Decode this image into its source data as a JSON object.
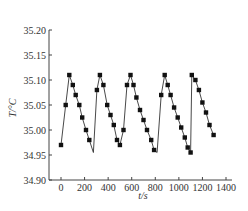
{
  "chart_data": {
    "type": "line",
    "title": "",
    "xlabel": "t/s",
    "ylabel": "T/°C",
    "xlim": [
      -50,
      1400
    ],
    "ylim": [
      34.9,
      35.2
    ],
    "x_ticks": [
      0,
      200,
      400,
      600,
      800,
      1000,
      1200,
      1400
    ],
    "x_tick_labels": [
      "0",
      "200",
      "400",
      "600",
      "800",
      "1000",
      "1200",
      "1400"
    ],
    "y_ticks": [
      34.9,
      34.95,
      35.0,
      35.05,
      35.1,
      35.15,
      35.2
    ],
    "y_tick_labels": [
      "34.90",
      "34.95",
      "35.00",
      "35.05",
      "35.10",
      "35.15",
      "35.20"
    ],
    "grid": false,
    "legend": null,
    "series": [
      {
        "name": "T",
        "marker": "square",
        "color": "#111111",
        "line_points": [
          [
            0,
            34.97
          ],
          [
            40,
            35.05
          ],
          [
            70,
            35.11
          ],
          [
            100,
            35.09
          ],
          [
            125,
            35.07
          ],
          [
            155,
            35.05
          ],
          [
            180,
            35.025
          ],
          [
            212,
            35.0
          ],
          [
            240,
            34.98
          ],
          [
            275,
            34.955
          ],
          [
            305,
            35.08
          ],
          [
            330,
            35.11
          ],
          [
            360,
            35.09
          ],
          [
            392,
            35.05
          ],
          [
            420,
            35.03
          ],
          [
            448,
            35.01
          ],
          [
            475,
            34.98
          ],
          [
            500,
            34.97
          ],
          [
            530,
            35.0
          ],
          [
            560,
            35.09
          ],
          [
            590,
            35.11
          ],
          [
            615,
            35.09
          ],
          [
            640,
            35.065
          ],
          [
            670,
            35.04
          ],
          [
            700,
            35.02
          ],
          [
            730,
            35.0
          ],
          [
            765,
            34.98
          ],
          [
            790,
            34.96
          ],
          [
            815,
            34.955
          ],
          [
            850,
            35.07
          ],
          [
            880,
            35.11
          ],
          [
            905,
            35.09
          ],
          [
            930,
            35.07
          ],
          [
            960,
            35.045
          ],
          [
            990,
            35.025
          ],
          [
            1020,
            35.005
          ],
          [
            1050,
            34.985
          ],
          [
            1075,
            34.965
          ],
          [
            1100,
            34.955
          ],
          [
            1110,
            35.11
          ],
          [
            1140,
            35.1
          ],
          [
            1170,
            35.08
          ],
          [
            1200,
            35.055
          ],
          [
            1230,
            35.035
          ],
          [
            1260,
            35.01
          ],
          [
            1295,
            34.99
          ]
        ],
        "markers": [
          [
            0,
            34.97
          ],
          [
            40,
            35.05
          ],
          [
            70,
            35.11
          ],
          [
            100,
            35.09
          ],
          [
            125,
            35.07
          ],
          [
            155,
            35.05
          ],
          [
            180,
            35.025
          ],
          [
            212,
            35.0
          ],
          [
            240,
            34.98
          ],
          [
            305,
            35.08
          ],
          [
            330,
            35.11
          ],
          [
            360,
            35.09
          ],
          [
            392,
            35.05
          ],
          [
            420,
            35.03
          ],
          [
            448,
            35.01
          ],
          [
            475,
            34.98
          ],
          [
            500,
            34.97
          ],
          [
            530,
            35.0
          ],
          [
            560,
            35.09
          ],
          [
            590,
            35.11
          ],
          [
            615,
            35.09
          ],
          [
            640,
            35.065
          ],
          [
            670,
            35.04
          ],
          [
            700,
            35.02
          ],
          [
            730,
            35.0
          ],
          [
            765,
            34.98
          ],
          [
            790,
            34.96
          ],
          [
            850,
            35.07
          ],
          [
            880,
            35.11
          ],
          [
            905,
            35.09
          ],
          [
            930,
            35.07
          ],
          [
            960,
            35.045
          ],
          [
            990,
            35.025
          ],
          [
            1020,
            35.005
          ],
          [
            1050,
            34.985
          ],
          [
            1075,
            34.965
          ],
          [
            1100,
            34.955
          ],
          [
            1110,
            35.11
          ],
          [
            1140,
            35.1
          ],
          [
            1170,
            35.08
          ],
          [
            1200,
            35.055
          ],
          [
            1230,
            35.035
          ],
          [
            1260,
            35.01
          ],
          [
            1295,
            34.99
          ]
        ]
      }
    ]
  },
  "layout": {
    "plot_left_px": 49,
    "plot_bottom_px": 180,
    "plot_top_px": 30,
    "plot_right_px": 232,
    "x0_px": 61,
    "px_per_second": 0.11786,
    "px_per_degree": 500,
    "axis_color": "#444444",
    "line_color": "#333333",
    "marker_color": "#111111"
  }
}
